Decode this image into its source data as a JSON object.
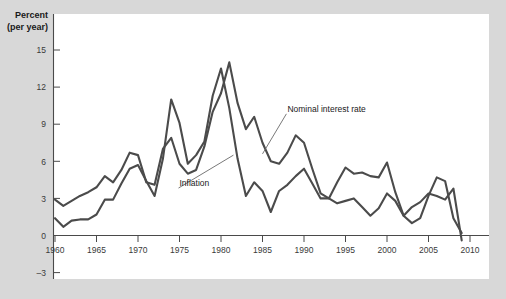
{
  "chart_data": {
    "type": "line",
    "title": "",
    "subtitle": "",
    "xlabel": "",
    "ylabel": "Percent",
    "ylabel_line2": "(per year)",
    "xlim": [
      1960,
      2010
    ],
    "ylim": [
      -3,
      15
    ],
    "yticks": [
      15,
      12,
      9,
      6,
      3,
      0,
      -3
    ],
    "ytick_labels": [
      "15",
      "12",
      "9",
      "6",
      "3",
      "0",
      "–3"
    ],
    "xticks": [
      1960,
      1965,
      1970,
      1975,
      1980,
      1985,
      1990,
      1995,
      2000,
      2005,
      2010
    ],
    "xtick_labels": [
      "1960",
      "1965",
      "1970",
      "1975",
      "1980",
      "1985",
      "1990",
      "1995",
      "2000",
      "2005",
      "2010"
    ],
    "grid": false,
    "legend": "inline-annotations",
    "series_color": "#4b4b4b",
    "annotations": [
      {
        "name": "nominal-interest-rate-label",
        "text": "Nominal interest rate",
        "x": 1988.0,
        "y": 10.0,
        "leader_to_x": 1985.0,
        "leader_to_y": 6.6
      },
      {
        "name": "inflation-label",
        "text": "Inflation",
        "x": 1975.0,
        "y": 4.0,
        "leader_to_x": 1981.5,
        "leader_to_y": 6.5
      }
    ],
    "x": [
      1960,
      1961,
      1962,
      1963,
      1964,
      1965,
      1966,
      1967,
      1968,
      1969,
      1970,
      1971,
      1972,
      1973,
      1974,
      1975,
      1976,
      1977,
      1978,
      1979,
      1980,
      1981,
      1982,
      1983,
      1984,
      1985,
      1986,
      1987,
      1988,
      1989,
      1990,
      1991,
      1992,
      1993,
      1994,
      1995,
      1996,
      1997,
      1998,
      1999,
      2000,
      2001,
      2002,
      2003,
      2004,
      2005,
      2006,
      2007,
      2008,
      2009
    ],
    "series": [
      {
        "name": "Nominal interest rate",
        "values": [
          2.9,
          2.4,
          2.8,
          3.2,
          3.5,
          3.9,
          4.8,
          4.3,
          5.3,
          6.7,
          6.5,
          4.3,
          4.1,
          7.0,
          7.9,
          5.8,
          5.0,
          5.3,
          7.2,
          10.0,
          11.5,
          14.0,
          10.7,
          8.6,
          9.6,
          7.5,
          6.0,
          5.8,
          6.7,
          8.1,
          7.5,
          5.4,
          3.4,
          3.0,
          4.3,
          5.5,
          5.0,
          5.1,
          4.8,
          4.7,
          5.9,
          3.5,
          1.6,
          1.0,
          1.4,
          3.2,
          4.7,
          4.4,
          1.4,
          0.2
        ],
        "color": "#4b4b4b"
      },
      {
        "name": "Inflation",
        "values": [
          1.4,
          0.7,
          1.2,
          1.3,
          1.3,
          1.7,
          2.9,
          2.9,
          4.2,
          5.4,
          5.7,
          4.4,
          3.2,
          6.2,
          11.0,
          9.1,
          5.8,
          6.5,
          7.6,
          11.3,
          13.5,
          10.3,
          6.2,
          3.2,
          4.3,
          3.6,
          1.9,
          3.6,
          4.1,
          4.8,
          5.4,
          4.2,
          3.0,
          3.0,
          2.6,
          2.8,
          3.0,
          2.3,
          1.6,
          2.2,
          3.4,
          2.8,
          1.6,
          2.3,
          2.7,
          3.4,
          3.2,
          2.9,
          3.8,
          -0.4
        ],
        "color": "#4b4b4b"
      }
    ]
  }
}
